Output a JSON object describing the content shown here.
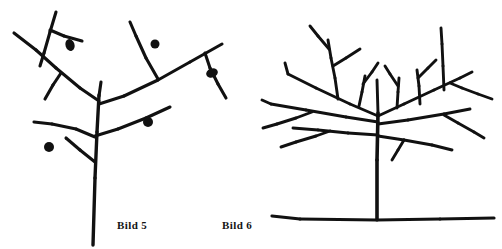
{
  "figure": {
    "type": "line-drawing",
    "background_color": "#ffffff",
    "ink_color": "#111111",
    "panels": [
      {
        "id": "panel-left",
        "caption": "Bild 5",
        "subject": "fruit-tree-with-fruit",
        "has_ground_line": false,
        "fruit_count": 5
      },
      {
        "id": "panel-right",
        "caption": "Bild 6",
        "subject": "bare-pruned-tree",
        "has_ground_line": true,
        "fruit_count": 0
      }
    ]
  },
  "captions": {
    "left": "Bild 5",
    "right": "Bild 6"
  },
  "drawing": {
    "ink": "#111111",
    "left_tree": {
      "trunk": [
        {
          "x1": 99,
          "y1": 95,
          "x2": 97,
          "y2": 132
        },
        {
          "x1": 97,
          "y1": 132,
          "x2": 95,
          "y2": 178
        },
        {
          "x1": 95,
          "y1": 178,
          "x2": 93,
          "y2": 245
        }
      ],
      "branches": [
        {
          "x1": 99,
          "y1": 96,
          "x2": 101,
          "y2": 82
        },
        {
          "x1": 99,
          "y1": 101,
          "x2": 80,
          "y2": 88
        },
        {
          "x1": 80,
          "y1": 88,
          "x2": 56,
          "y2": 68
        },
        {
          "x1": 56,
          "y1": 68,
          "x2": 36,
          "y2": 50
        },
        {
          "x1": 36,
          "y1": 50,
          "x2": 14,
          "y2": 33
        },
        {
          "x1": 61,
          "y1": 73,
          "x2": 53,
          "y2": 85
        },
        {
          "x1": 53,
          "y1": 85,
          "x2": 45,
          "y2": 99
        },
        {
          "x1": 56,
          "y1": 12,
          "x2": 50,
          "y2": 32
        },
        {
          "x1": 50,
          "y1": 32,
          "x2": 44,
          "y2": 53
        },
        {
          "x1": 44,
          "y1": 53,
          "x2": 40,
          "y2": 66
        },
        {
          "x1": 50,
          "y1": 30,
          "x2": 64,
          "y2": 36
        },
        {
          "x1": 64,
          "y1": 36,
          "x2": 82,
          "y2": 41
        },
        {
          "x1": 99,
          "y1": 104,
          "x2": 124,
          "y2": 96
        },
        {
          "x1": 124,
          "y1": 96,
          "x2": 158,
          "y2": 80
        },
        {
          "x1": 158,
          "y1": 80,
          "x2": 190,
          "y2": 62
        },
        {
          "x1": 190,
          "y1": 62,
          "x2": 222,
          "y2": 44
        },
        {
          "x1": 158,
          "y1": 79,
          "x2": 146,
          "y2": 58
        },
        {
          "x1": 146,
          "y1": 58,
          "x2": 136,
          "y2": 36
        },
        {
          "x1": 136,
          "y1": 36,
          "x2": 130,
          "y2": 22
        },
        {
          "x1": 205,
          "y1": 53,
          "x2": 210,
          "y2": 68
        },
        {
          "x1": 210,
          "y1": 68,
          "x2": 218,
          "y2": 84
        },
        {
          "x1": 218,
          "y1": 84,
          "x2": 226,
          "y2": 98
        },
        {
          "x1": 95,
          "y1": 136,
          "x2": 118,
          "y2": 129
        },
        {
          "x1": 118,
          "y1": 129,
          "x2": 146,
          "y2": 118
        },
        {
          "x1": 146,
          "y1": 118,
          "x2": 170,
          "y2": 107
        },
        {
          "x1": 95,
          "y1": 137,
          "x2": 76,
          "y2": 129
        },
        {
          "x1": 76,
          "y1": 129,
          "x2": 52,
          "y2": 124
        },
        {
          "x1": 52,
          "y1": 124,
          "x2": 34,
          "y2": 122
        },
        {
          "x1": 95,
          "y1": 162,
          "x2": 80,
          "y2": 150
        },
        {
          "x1": 80,
          "y1": 150,
          "x2": 66,
          "y2": 138
        }
      ],
      "fruits": [
        {
          "cx": 70,
          "cy": 45,
          "rx": 4.5,
          "ry": 6.0,
          "rot": -18
        },
        {
          "cx": 155,
          "cy": 44,
          "rx": 4.5,
          "ry": 4.5,
          "rot": 0
        },
        {
          "cx": 212,
          "cy": 73,
          "rx": 6.0,
          "ry": 4.5,
          "rot": -20
        },
        {
          "cx": 148,
          "cy": 122,
          "rx": 5.0,
          "ry": 5.0,
          "rot": 0
        },
        {
          "cx": 49,
          "cy": 147,
          "rx": 5.0,
          "ry": 5.0,
          "rot": 0
        }
      ]
    },
    "right_tree": {
      "trunk": [
        {
          "x1": 378,
          "y1": 113,
          "x2": 377,
          "y2": 160
        },
        {
          "x1": 377,
          "y1": 160,
          "x2": 377,
          "y2": 219
        }
      ],
      "ground": [
        {
          "x1": 272,
          "y1": 216,
          "x2": 300,
          "y2": 219
        },
        {
          "x1": 300,
          "y1": 219,
          "x2": 377,
          "y2": 220
        },
        {
          "x1": 377,
          "y1": 220,
          "x2": 440,
          "y2": 219
        },
        {
          "x1": 440,
          "y1": 219,
          "x2": 494,
          "y2": 218
        }
      ],
      "branches": [
        {
          "x1": 378,
          "y1": 113,
          "x2": 377,
          "y2": 80
        },
        {
          "x1": 378,
          "y1": 116,
          "x2": 350,
          "y2": 104
        },
        {
          "x1": 350,
          "y1": 104,
          "x2": 316,
          "y2": 88
        },
        {
          "x1": 316,
          "y1": 88,
          "x2": 288,
          "y2": 74
        },
        {
          "x1": 288,
          "y1": 74,
          "x2": 285,
          "y2": 63
        },
        {
          "x1": 378,
          "y1": 122,
          "x2": 346,
          "y2": 117
        },
        {
          "x1": 346,
          "y1": 117,
          "x2": 306,
          "y2": 110
        },
        {
          "x1": 306,
          "y1": 110,
          "x2": 271,
          "y2": 104
        },
        {
          "x1": 271,
          "y1": 104,
          "x2": 262,
          "y2": 100
        },
        {
          "x1": 312,
          "y1": 112,
          "x2": 296,
          "y2": 118
        },
        {
          "x1": 296,
          "y1": 118,
          "x2": 277,
          "y2": 124
        },
        {
          "x1": 277,
          "y1": 124,
          "x2": 263,
          "y2": 128
        },
        {
          "x1": 378,
          "y1": 135,
          "x2": 348,
          "y2": 133
        },
        {
          "x1": 348,
          "y1": 133,
          "x2": 318,
          "y2": 130
        },
        {
          "x1": 318,
          "y1": 130,
          "x2": 293,
          "y2": 128
        },
        {
          "x1": 330,
          "y1": 131,
          "x2": 316,
          "y2": 136
        },
        {
          "x1": 316,
          "y1": 136,
          "x2": 296,
          "y2": 142
        },
        {
          "x1": 296,
          "y1": 142,
          "x2": 281,
          "y2": 147
        },
        {
          "x1": 338,
          "y1": 99,
          "x2": 335,
          "y2": 78
        },
        {
          "x1": 335,
          "y1": 78,
          "x2": 331,
          "y2": 58
        },
        {
          "x1": 331,
          "y1": 58,
          "x2": 328,
          "y2": 40
        },
        {
          "x1": 333,
          "y1": 66,
          "x2": 346,
          "y2": 58
        },
        {
          "x1": 346,
          "y1": 58,
          "x2": 360,
          "y2": 49
        },
        {
          "x1": 329,
          "y1": 49,
          "x2": 318,
          "y2": 36
        },
        {
          "x1": 318,
          "y1": 36,
          "x2": 310,
          "y2": 26
        },
        {
          "x1": 359,
          "y1": 106,
          "x2": 362,
          "y2": 92
        },
        {
          "x1": 362,
          "y1": 92,
          "x2": 365,
          "y2": 76
        },
        {
          "x1": 363,
          "y1": 84,
          "x2": 372,
          "y2": 72
        },
        {
          "x1": 372,
          "y1": 72,
          "x2": 378,
          "y2": 63
        },
        {
          "x1": 378,
          "y1": 116,
          "x2": 404,
          "y2": 104
        },
        {
          "x1": 404,
          "y1": 104,
          "x2": 434,
          "y2": 90
        },
        {
          "x1": 434,
          "y1": 90,
          "x2": 460,
          "y2": 78
        },
        {
          "x1": 460,
          "y1": 78,
          "x2": 472,
          "y2": 72
        },
        {
          "x1": 450,
          "y1": 83,
          "x2": 462,
          "y2": 88
        },
        {
          "x1": 462,
          "y1": 88,
          "x2": 478,
          "y2": 94
        },
        {
          "x1": 478,
          "y1": 94,
          "x2": 492,
          "y2": 99
        },
        {
          "x1": 378,
          "y1": 124,
          "x2": 408,
          "y2": 120
        },
        {
          "x1": 408,
          "y1": 120,
          "x2": 444,
          "y2": 114
        },
        {
          "x1": 444,
          "y1": 114,
          "x2": 470,
          "y2": 109
        },
        {
          "x1": 444,
          "y1": 115,
          "x2": 458,
          "y2": 123
        },
        {
          "x1": 458,
          "y1": 123,
          "x2": 474,
          "y2": 132
        },
        {
          "x1": 474,
          "y1": 132,
          "x2": 484,
          "y2": 138
        },
        {
          "x1": 378,
          "y1": 136,
          "x2": 404,
          "y2": 140
        },
        {
          "x1": 404,
          "y1": 140,
          "x2": 432,
          "y2": 145
        },
        {
          "x1": 432,
          "y1": 145,
          "x2": 452,
          "y2": 150
        },
        {
          "x1": 420,
          "y1": 104,
          "x2": 419,
          "y2": 86
        },
        {
          "x1": 419,
          "y1": 86,
          "x2": 417,
          "y2": 70
        },
        {
          "x1": 418,
          "y1": 78,
          "x2": 428,
          "y2": 68
        },
        {
          "x1": 428,
          "y1": 68,
          "x2": 436,
          "y2": 60
        },
        {
          "x1": 397,
          "y1": 108,
          "x2": 398,
          "y2": 92
        },
        {
          "x1": 398,
          "y1": 92,
          "x2": 399,
          "y2": 78
        },
        {
          "x1": 398,
          "y1": 86,
          "x2": 390,
          "y2": 74
        },
        {
          "x1": 390,
          "y1": 74,
          "x2": 385,
          "y2": 66
        },
        {
          "x1": 444,
          "y1": 90,
          "x2": 443,
          "y2": 66
        },
        {
          "x1": 443,
          "y1": 66,
          "x2": 442,
          "y2": 44
        },
        {
          "x1": 442,
          "y1": 44,
          "x2": 441,
          "y2": 28
        },
        {
          "x1": 404,
          "y1": 140,
          "x2": 398,
          "y2": 150
        },
        {
          "x1": 398,
          "y1": 150,
          "x2": 392,
          "y2": 160
        }
      ]
    }
  }
}
